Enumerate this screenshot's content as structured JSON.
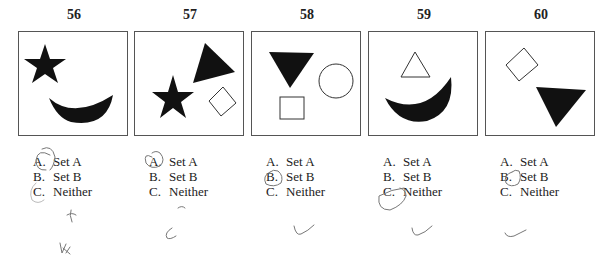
{
  "questions": [
    {
      "number": "56",
      "shapes": [
        "filled-star",
        "filled-crescent"
      ],
      "options": [
        {
          "letter": "A.",
          "label": "Set A"
        },
        {
          "letter": "B.",
          "label": "Set B"
        },
        {
          "letter": "C.",
          "label": "Neither"
        }
      ],
      "circled": "A",
      "handwritten_mark": "x"
    },
    {
      "number": "57",
      "shapes": [
        "filled-triangle",
        "filled-star",
        "outline-diamond"
      ],
      "options": [
        {
          "letter": "A.",
          "label": "Set A"
        },
        {
          "letter": "B.",
          "label": "Set B"
        },
        {
          "letter": "C.",
          "label": "Neither"
        }
      ],
      "circled": "A",
      "handwritten_mark": "C"
    },
    {
      "number": "58",
      "shapes": [
        "filled-inverted-triangle",
        "outline-circle",
        "outline-square"
      ],
      "options": [
        {
          "letter": "A.",
          "label": "Set A"
        },
        {
          "letter": "B.",
          "label": "Set B"
        },
        {
          "letter": "C.",
          "label": "Neither"
        }
      ],
      "circled": "B",
      "handwritten_mark": "check"
    },
    {
      "number": "59",
      "shapes": [
        "outline-triangle",
        "filled-crescent"
      ],
      "options": [
        {
          "letter": "A.",
          "label": "Set A"
        },
        {
          "letter": "B.",
          "label": "Set B"
        },
        {
          "letter": "C.",
          "label": "Neither"
        }
      ],
      "circled": "C",
      "handwritten_mark": "check"
    },
    {
      "number": "60",
      "shapes": [
        "outline-diamond",
        "filled-inverted-triangle"
      ],
      "options": [
        {
          "letter": "A.",
          "label": "Set A"
        },
        {
          "letter": "B.",
          "label": "Set B"
        },
        {
          "letter": "C.",
          "label": "Neither"
        }
      ],
      "circled": "B",
      "handwritten_mark": "check"
    }
  ]
}
